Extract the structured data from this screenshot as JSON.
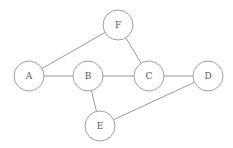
{
  "diagram": {
    "type": "undirected-graph",
    "colors": {
      "edge": "#9a9a9a",
      "node_stroke": "#a0a0a0",
      "label": "#555555",
      "background": "#ffffff"
    },
    "nodes": [
      {
        "id": "A",
        "label": "A",
        "x": 29,
        "y": 76,
        "r": 15
      },
      {
        "id": "B",
        "label": "B",
        "x": 88,
        "y": 76,
        "r": 15
      },
      {
        "id": "C",
        "label": "C",
        "x": 149,
        "y": 76,
        "r": 15
      },
      {
        "id": "D",
        "label": "D",
        "x": 208,
        "y": 76,
        "r": 15
      },
      {
        "id": "E",
        "label": "E",
        "x": 100,
        "y": 126,
        "r": 15
      },
      {
        "id": "F",
        "label": "F",
        "x": 118,
        "y": 25,
        "r": 15
      }
    ],
    "edges": [
      {
        "from": "A",
        "to": "F"
      },
      {
        "from": "A",
        "to": "B"
      },
      {
        "from": "B",
        "to": "C"
      },
      {
        "from": "F",
        "to": "C"
      },
      {
        "from": "C",
        "to": "D"
      },
      {
        "from": "B",
        "to": "E"
      },
      {
        "from": "E",
        "to": "D"
      }
    ]
  }
}
